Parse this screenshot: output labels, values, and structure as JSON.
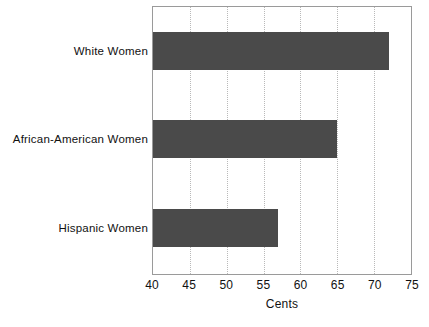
{
  "chart_data": {
    "type": "bar",
    "orientation": "horizontal",
    "title": "",
    "xlabel": "Cents",
    "ylabel": "",
    "categories": [
      "White Women",
      "African-American Women",
      "Hispanic Women"
    ],
    "values": [
      72,
      65,
      57
    ],
    "xlim": [
      40,
      75
    ],
    "xticks": [
      40,
      45,
      50,
      55,
      60,
      65,
      70,
      75
    ],
    "xtick_labels": [
      "40",
      "45",
      "50",
      "55",
      "60",
      "65",
      "70",
      "75"
    ],
    "grid": "vertical-dotted-interior",
    "legend": "none",
    "bar_color": "#4a4a4a",
    "frame_color": "#9a9a9a",
    "gridline_color": "#b9b9b9",
    "background": "#ffffff"
  },
  "caption": {
    "text": ""
  }
}
